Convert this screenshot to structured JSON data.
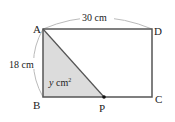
{
  "figure": {
    "vertices": {
      "A": {
        "label": "A",
        "x": 43,
        "y": 29
      },
      "B": {
        "label": "B",
        "x": 43,
        "y": 97
      },
      "C": {
        "label": "C",
        "x": 152,
        "y": 97
      },
      "D": {
        "label": "D",
        "x": 152,
        "y": 29
      },
      "P": {
        "label": "P",
        "x": 104,
        "y": 97
      }
    },
    "dimensions": {
      "top": "30 cm",
      "left": "18 cm"
    },
    "area_label": {
      "var": "y",
      "unit": " cm",
      "exp": "2"
    },
    "colors": {
      "edge": "#555555",
      "shade": "#dcdcdc",
      "arc": "#bbbbbb",
      "point": "#111111"
    }
  }
}
